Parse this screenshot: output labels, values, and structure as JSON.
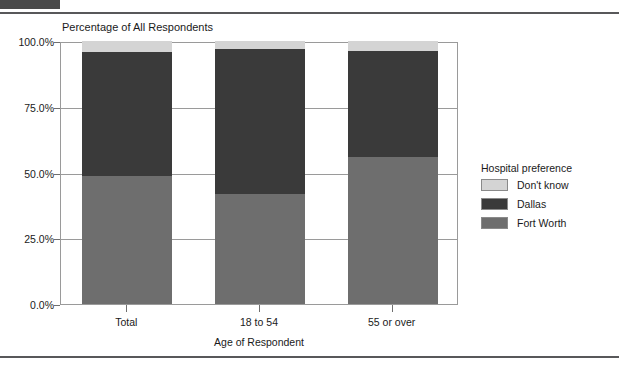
{
  "chart_data": {
    "type": "bar",
    "subtype": "stacked-percentage",
    "title": "Percentage of All Respondents",
    "xlabel": "Age of Respondent",
    "ylabel": "",
    "categories": [
      "Total",
      "18 to 54",
      "55 or over"
    ],
    "series": [
      {
        "name": "Fort Worth",
        "color": "#6e6e6e",
        "values": [
          48.5,
          41.9,
          55.9
        ]
      },
      {
        "name": "Dallas",
        "color": "#3a3a3a",
        "values": [
          47.5,
          55.1,
          40.3
        ]
      },
      {
        "name": "Don't know",
        "color": "#d4d4d4",
        "values": [
          4.0,
          3.0,
          3.8
        ]
      }
    ],
    "ylim": [
      0,
      100
    ],
    "yticks": [
      0,
      25,
      50,
      75,
      100
    ],
    "ytick_labels": [
      "0.0%",
      "25.0%",
      "50.0%",
      "75.0%",
      "100.0%"
    ],
    "grid": true,
    "legend_position": "right"
  },
  "legend": {
    "title": "Hospital preference",
    "entries": [
      {
        "label": "Don't know",
        "color": "#d4d4d4"
      },
      {
        "label": "Dallas",
        "color": "#3a3a3a"
      },
      {
        "label": "Fort Worth",
        "color": "#6e6e6e"
      }
    ]
  },
  "colors": {
    "dont_know": "#d4d4d4",
    "dallas": "#3a3a3a",
    "fort_worth": "#6e6e6e",
    "axis": "#9a9a9a",
    "rule": "#58585a"
  }
}
